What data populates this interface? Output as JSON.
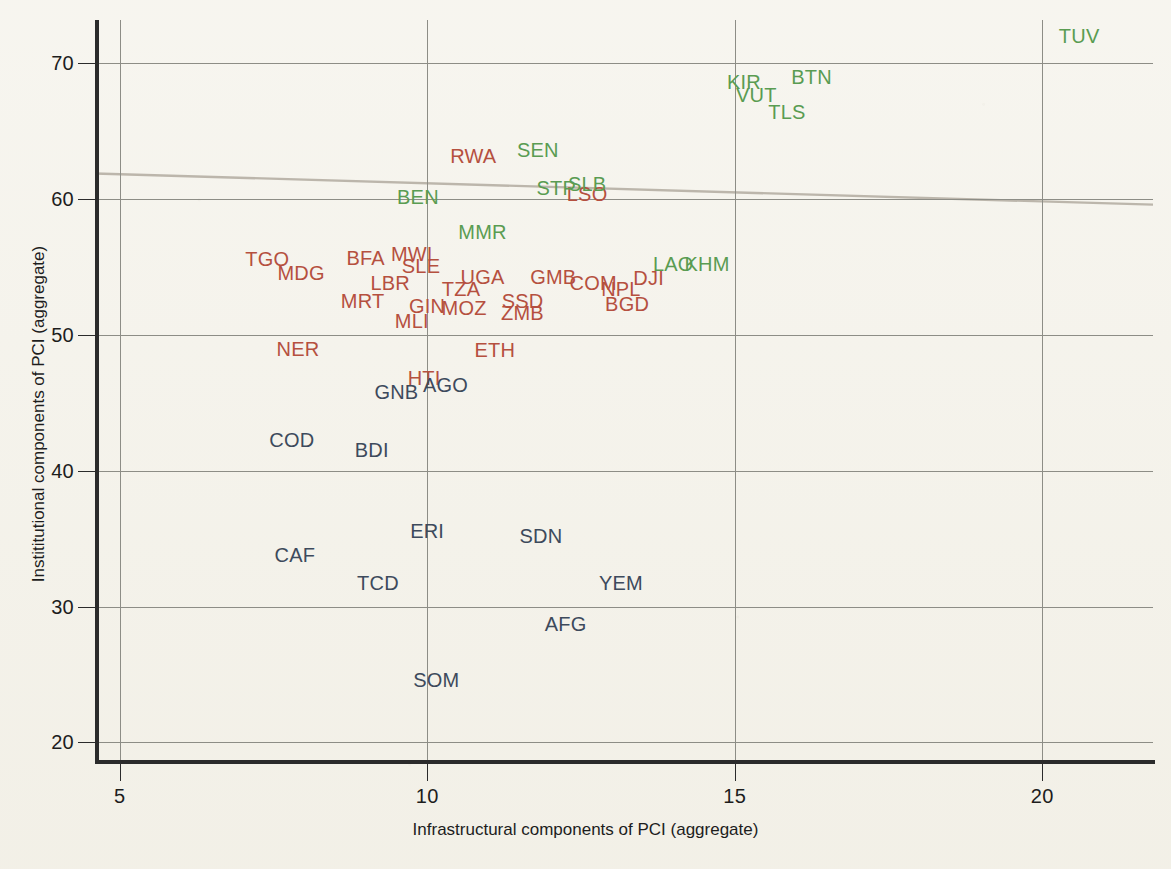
{
  "chart_data": {
    "type": "scatter",
    "title": "",
    "xlabel": "Infrastructural components of PCI (aggregate)",
    "ylabel": "Instititutional components of PCI (aggregate)",
    "xlim": [
      4.6,
      21.8
    ],
    "ylim": [
      18.7,
      73.2
    ],
    "xticks": [
      5,
      10,
      15,
      20
    ],
    "yticks": [
      20,
      30,
      40,
      50,
      60,
      70
    ],
    "grid": true,
    "legend": "none",
    "colors": {
      "red": "#b5503f",
      "green": "#5a9c52",
      "blue": "#3d4a5c",
      "background": "#f4f2ea",
      "axis": "#2b2b2b",
      "gridline": "#8d8d86",
      "trendline": "#a9a296"
    },
    "trendline": {
      "visible": true,
      "x_start": 4.6,
      "y_start": 61.9,
      "x_end": 21.8,
      "y_end": 59.6
    },
    "point_label_mode": "text-only-no-markers",
    "series": [
      {
        "name": "red",
        "color": "#b5503f",
        "points": [
          {
            "label": "RWA",
            "x": 10.75,
            "y": 63.2
          },
          {
            "label": "LSO",
            "x": 12.6,
            "y": 60.4
          },
          {
            "label": "TGO",
            "x": 7.4,
            "y": 55.6
          },
          {
            "label": "BFA",
            "x": 9.0,
            "y": 55.7
          },
          {
            "label": "MWI",
            "x": 9.75,
            "y": 56.0
          },
          {
            "label": "SLE",
            "x": 9.9,
            "y": 55.1
          },
          {
            "label": "MDG",
            "x": 7.95,
            "y": 54.6
          },
          {
            "label": "LBR",
            "x": 9.4,
            "y": 53.8
          },
          {
            "label": "UGA",
            "x": 10.9,
            "y": 54.3
          },
          {
            "label": "GMB",
            "x": 12.05,
            "y": 54.3
          },
          {
            "label": "COM",
            "x": 12.7,
            "y": 53.8
          },
          {
            "label": "NPL",
            "x": 13.15,
            "y": 53.4
          },
          {
            "label": "DJI",
            "x": 13.6,
            "y": 54.2
          },
          {
            "label": "TZA",
            "x": 10.55,
            "y": 53.4
          },
          {
            "label": "MRT",
            "x": 8.95,
            "y": 52.5
          },
          {
            "label": "GIN",
            "x": 10.0,
            "y": 52.1
          },
          {
            "label": "MOZ",
            "x": 10.6,
            "y": 52.0
          },
          {
            "label": "SSD",
            "x": 11.55,
            "y": 52.5
          },
          {
            "label": "ZMB",
            "x": 11.55,
            "y": 51.6
          },
          {
            "label": "BGD",
            "x": 13.25,
            "y": 52.3
          },
          {
            "label": "MLI",
            "x": 9.75,
            "y": 51.0
          },
          {
            "label": "NER",
            "x": 7.9,
            "y": 49.0
          },
          {
            "label": "ETH",
            "x": 11.1,
            "y": 48.9
          },
          {
            "label": "HTI",
            "x": 9.95,
            "y": 46.8
          }
        ]
      },
      {
        "name": "green",
        "color": "#5a9c52",
        "points": [
          {
            "label": "TUV",
            "x": 20.6,
            "y": 72.0
          },
          {
            "label": "BTN",
            "x": 16.25,
            "y": 69.0
          },
          {
            "label": "KIR",
            "x": 15.15,
            "y": 68.6
          },
          {
            "label": "VUT",
            "x": 15.35,
            "y": 67.7
          },
          {
            "label": "TLS",
            "x": 15.85,
            "y": 66.4
          },
          {
            "label": "SEN",
            "x": 11.8,
            "y": 63.6
          },
          {
            "label": "STP",
            "x": 12.1,
            "y": 60.8
          },
          {
            "label": "SLB",
            "x": 12.6,
            "y": 61.1
          },
          {
            "label": "BEN",
            "x": 9.85,
            "y": 60.2
          },
          {
            "label": "MMR",
            "x": 10.9,
            "y": 57.6
          },
          {
            "label": "LAO",
            "x": 14.0,
            "y": 55.2
          },
          {
            "label": "KHM",
            "x": 14.55,
            "y": 55.2
          }
        ]
      },
      {
        "name": "blue",
        "color": "#3d4a5c",
        "points": [
          {
            "label": "AGO",
            "x": 10.3,
            "y": 46.3
          },
          {
            "label": "GNB",
            "x": 9.5,
            "y": 45.8
          },
          {
            "label": "COD",
            "x": 7.8,
            "y": 42.3
          },
          {
            "label": "BDI",
            "x": 9.1,
            "y": 41.5
          },
          {
            "label": "ERI",
            "x": 10.0,
            "y": 35.6
          },
          {
            "label": "SDN",
            "x": 11.85,
            "y": 35.2
          },
          {
            "label": "CAF",
            "x": 7.85,
            "y": 33.8
          },
          {
            "label": "TCD",
            "x": 9.2,
            "y": 31.7
          },
          {
            "label": "YEM",
            "x": 13.15,
            "y": 31.7
          },
          {
            "label": "AFG",
            "x": 12.25,
            "y": 28.7
          },
          {
            "label": "SOM",
            "x": 10.15,
            "y": 24.6
          }
        ]
      }
    ]
  }
}
